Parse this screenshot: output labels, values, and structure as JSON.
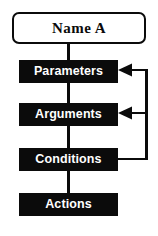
{
  "diagram": {
    "title": "Name A",
    "root_node": {
      "id": "name-a",
      "label": "Name A",
      "shape": "rounded-rectangle",
      "fill": "#ffffff",
      "stroke": "#0b0b0b",
      "text_color": "#0b0b0b"
    },
    "nodes": [
      {
        "id": "parameters",
        "label": "Parameters",
        "shape": "rectangle",
        "fill": "#0b0b0b",
        "text_color": "#ffffff"
      },
      {
        "id": "arguments",
        "label": "Arguments",
        "shape": "rectangle",
        "fill": "#0b0b0b",
        "text_color": "#ffffff"
      },
      {
        "id": "conditions",
        "label": "Conditions",
        "shape": "rectangle",
        "fill": "#0b0b0b",
        "text_color": "#ffffff"
      },
      {
        "id": "actions",
        "label": "Actions",
        "shape": "rectangle",
        "fill": "#0b0b0b",
        "text_color": "#ffffff"
      }
    ],
    "edges": [
      {
        "id": "edge-name-a-to-parameters",
        "from": "name-a",
        "to": "parameters",
        "style": "straight",
        "arrowhead": false
      },
      {
        "id": "edge-parameters-to-arguments",
        "from": "parameters",
        "to": "arguments",
        "style": "straight",
        "arrowhead": false
      },
      {
        "id": "edge-arguments-to-conditions",
        "from": "arguments",
        "to": "conditions",
        "style": "straight",
        "arrowhead": false
      },
      {
        "id": "edge-conditions-to-actions",
        "from": "conditions",
        "to": "actions",
        "style": "straight",
        "arrowhead": false
      },
      {
        "id": "edge-conditions-to-parameters",
        "from": "conditions",
        "to": "parameters",
        "style": "orthogonal-feedback",
        "arrowhead": true
      },
      {
        "id": "edge-conditions-to-arguments",
        "from": "conditions",
        "to": "arguments",
        "style": "orthogonal-feedback",
        "arrowhead": true
      }
    ],
    "line_color": "#0b0b0b",
    "background": "#ffffff"
  }
}
